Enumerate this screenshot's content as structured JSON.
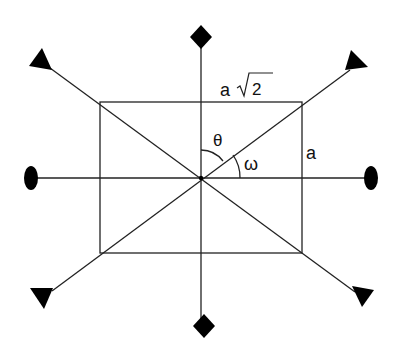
{
  "diagram": {
    "labels": {
      "top_side": "a",
      "top_side_sqrt": "2",
      "right_side": "a",
      "theta": "θ",
      "omega": "ω"
    },
    "geometry": {
      "center": [
        201,
        178
      ],
      "rectangle": {
        "x1": 100,
        "y1": 102,
        "x2": 302,
        "y2": 253
      },
      "axes": {
        "vertical": {
          "top": [
            201,
            38
          ],
          "bottom": [
            201,
            326
          ],
          "symbol": "diamond"
        },
        "horizontal": {
          "left": [
            31,
            178
          ],
          "right": [
            371,
            178
          ],
          "symbol": "ellipse"
        },
        "diagonal_1": {
          "from": [
            42,
            60
          ],
          "to": [
            362,
            297
          ],
          "symbol": "triangle"
        },
        "diagonal_2": {
          "from": [
            44,
            297
          ],
          "to": [
            357,
            64
          ],
          "symbol": "triangle"
        }
      }
    },
    "colors": {
      "line": "#222222",
      "fill": "#000000",
      "background": "#ffffff"
    }
  }
}
